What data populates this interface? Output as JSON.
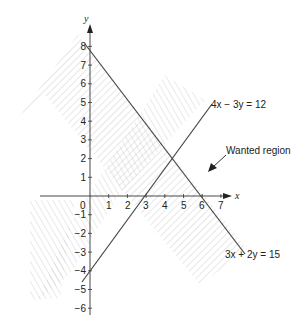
{
  "diagram": {
    "axes": {
      "x_label": "x",
      "y_label": "y",
      "x_ticks": [
        "1",
        "2",
        "3",
        "4",
        "5",
        "6",
        "7"
      ],
      "y_ticks_pos": [
        "1",
        "2",
        "3",
        "4",
        "5",
        "6",
        "7",
        "8"
      ],
      "y_ticks_neg": [
        "−1",
        "−2",
        "−3",
        "−4",
        "−5",
        "−6"
      ],
      "origin_label": "0"
    },
    "lines": [
      {
        "equation": "4x − 3y = 12",
        "color": "#444444"
      },
      {
        "equation": "3x + 2y = 15",
        "color": "#444444"
      }
    ],
    "annotation": "Wanted region",
    "hatch_color": "#bbbbbb",
    "axis_color": "#333333"
  }
}
